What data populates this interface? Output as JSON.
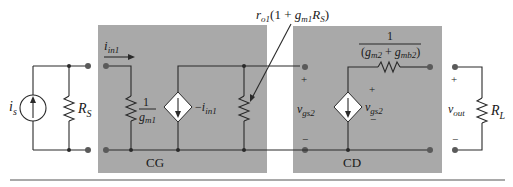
{
  "diagram": {
    "type": "small-signal equivalent circuit",
    "colors": {
      "box_fill": "#a9a9a9",
      "wire": "#2a2a2a",
      "background": "#ffffff"
    },
    "source": {
      "current_label_main": "i",
      "current_label_sub": "s",
      "resistor_label_main": "R",
      "resistor_label_sub": "S"
    },
    "cg_stage": {
      "box_label": "CG",
      "input_current_main": "i",
      "input_current_sub": "in1",
      "input_resistor_num": "1",
      "input_resistor_den_main": "g",
      "input_resistor_den_sub": "m1",
      "dependent_source_prefix": "−",
      "dependent_source_main": "i",
      "dependent_source_sub": "in1",
      "output_resistor_label": "r_o1(1 + g_m1 R_S)",
      "output_resistor_parts": {
        "r": "r",
        "r_sub": "o1",
        "open": "(1 + ",
        "g": "g",
        "g_sub": "m1",
        "R": "R",
        "R_sub": "S",
        "close": ")"
      }
    },
    "cd_stage": {
      "box_label": "CD",
      "input_voltage_main": "v",
      "input_voltage_sub": "gs2",
      "input_plus": "+",
      "input_minus": "−",
      "dependent_source_main": "v",
      "dependent_source_sub": "gs2",
      "dep_plus": "+",
      "dep_minus": "−",
      "output_resistor_num": "1",
      "output_resistor_den": {
        "open": "(",
        "g1": "g",
        "g1_sub": "m2",
        "plus": " + ",
        "g2": "g",
        "g2_sub": "mb2",
        "close": ")"
      }
    },
    "load": {
      "output_voltage_main": "v",
      "output_voltage_sub": "out",
      "plus": "+",
      "minus": "−",
      "resistor_label_main": "R",
      "resistor_label_sub": "L"
    }
  }
}
